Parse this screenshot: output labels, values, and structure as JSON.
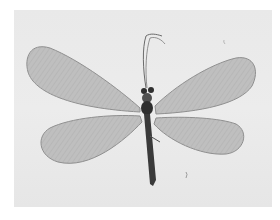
{
  "image": {
    "subject": "lacewing specimen, wings spread, dorsal view",
    "style": "grayscale photograph",
    "colors": {
      "page": "#ffffff",
      "backdrop": "#e9e9e9",
      "wing_fill": "#b9b9b9",
      "wing_edge": "#8a8a8a",
      "wing_vein": "#9e9e9e",
      "body": "#3a3a3a",
      "antenna": "#6a6a6a"
    }
  }
}
